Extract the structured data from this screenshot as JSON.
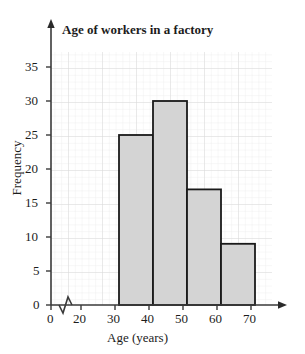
{
  "chart_data": {
    "type": "bar",
    "title": "Age of workers in a factory",
    "xlabel": "Age (years)",
    "ylabel": "Frequency",
    "categories": [
      "20-30",
      "30-40",
      "40-50",
      "50-60"
    ],
    "bin_edges": [
      20,
      30,
      40,
      50,
      60
    ],
    "values": [
      25,
      30,
      17,
      9
    ],
    "xlim": [
      0,
      70
    ],
    "ylim": [
      0,
      35
    ],
    "x_ticks": [
      "0",
      "20",
      "30",
      "40",
      "50",
      "60",
      "70"
    ],
    "y_ticks": [
      "0",
      "5",
      "10",
      "15",
      "20",
      "25",
      "30",
      "35"
    ],
    "x_axis_break": true,
    "grid": true,
    "legend": "none",
    "bar_fill_color": "#d4d4d4",
    "bar_edge_color": "#1a1a1a",
    "axis_color": "#3a3a3a",
    "grid_color": "#e9e9e9",
    "grid_major_color": "#dcdcdc"
  },
  "icons": {
    "y_axis_arrow": "arrow-up-icon",
    "x_axis_arrow": "arrow-right-icon",
    "axis_break": "axis-break-zigzag-icon"
  }
}
